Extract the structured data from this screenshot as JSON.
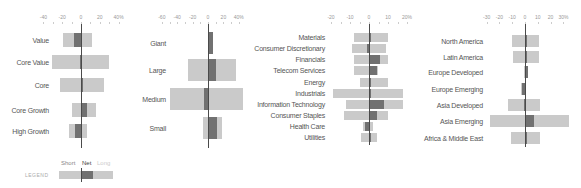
{
  "colors": {
    "light": "#cacaca",
    "net": "#717171",
    "axis": "#4a4a4a",
    "text": "#555555"
  },
  "legend": {
    "title": "LEGEND",
    "short": "Short",
    "net": "Net",
    "long": "Long"
  },
  "chart_data": [
    {
      "type": "bar",
      "orientation": "horizontal-diverging",
      "title": "Style",
      "xlim": [
        -40,
        40
      ],
      "xticks": [
        "-40",
        "-20",
        "0",
        "20",
        "40%"
      ],
      "categories": [
        "Value",
        "Core Value",
        "Core",
        "Core Growth",
        "High Growth"
      ],
      "series": [
        {
          "name": "Short",
          "values": [
            -19,
            -31,
            -22,
            -10,
            -13
          ]
        },
        {
          "name": "Long",
          "values": [
            12,
            30,
            25,
            16,
            6
          ]
        },
        {
          "name": "Net",
          "values": [
            -7,
            -1,
            2,
            6,
            -6
          ]
        }
      ]
    },
    {
      "type": "bar",
      "orientation": "horizontal-diverging",
      "title": "Market Cap",
      "xlim": [
        -60,
        40
      ],
      "xticks": [
        "-60",
        "-40",
        "-20",
        "0",
        "20",
        "40%"
      ],
      "categories": [
        "Giant",
        "Large",
        "Medium",
        "Small"
      ],
      "series": [
        {
          "name": "Short",
          "values": [
            0,
            -26,
            -49,
            -6
          ]
        },
        {
          "name": "Long",
          "values": [
            6,
            36,
            45,
            18
          ]
        },
        {
          "name": "Net",
          "values": [
            6,
            10,
            -5,
            12
          ]
        }
      ]
    },
    {
      "type": "bar",
      "orientation": "horizontal-diverging",
      "title": "Sector",
      "xlim": [
        -20,
        20
      ],
      "xticks": [
        "-20",
        "-10",
        "0",
        "10",
        "20%"
      ],
      "categories": [
        "Materials",
        "Consumer Discretionary",
        "Financials",
        "Telecom Services",
        "Energy",
        "Industrials",
        "Information Technology",
        "Consumer Staples",
        "Health Care",
        "Utilities"
      ],
      "series": [
        {
          "name": "Short",
          "values": [
            -8,
            -9,
            -8,
            -8,
            -5,
            -19,
            -12,
            -13,
            -3,
            -4
          ]
        },
        {
          "name": "Long",
          "values": [
            10,
            9,
            10,
            5,
            10,
            18,
            18,
            10,
            2,
            4
          ]
        },
        {
          "name": "Net",
          "values": [
            1,
            -1,
            6,
            4,
            0,
            1,
            8,
            4,
            -2,
            0.5
          ]
        }
      ]
    },
    {
      "type": "bar",
      "orientation": "horizontal-diverging",
      "title": "Region",
      "xlim": [
        -30,
        30
      ],
      "xticks": [
        "-30",
        "-20",
        "-10",
        "0",
        "10",
        "20",
        "30%"
      ],
      "categories": [
        "North America",
        "Latin America",
        "Europe Developed",
        "Europe Emerging",
        "Asia Developed",
        "Asia Emerging",
        "Africa & Middle East"
      ],
      "series": [
        {
          "name": "Short",
          "values": [
            -10,
            -9,
            -1,
            -3,
            -13,
            -27,
            -11
          ]
        },
        {
          "name": "Long",
          "values": [
            11,
            11,
            2,
            1,
            12,
            34,
            12
          ]
        },
        {
          "name": "Net",
          "values": [
            0,
            1.5,
            2,
            -2,
            -1,
            7,
            1
          ]
        }
      ]
    }
  ]
}
